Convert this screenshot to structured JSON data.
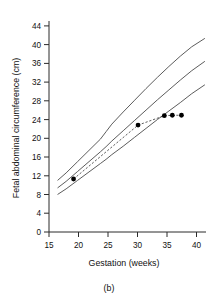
{
  "chart_data": {
    "type": "line",
    "title": "",
    "caption": "(b)",
    "xlabel": "Gestation (weeks)",
    "ylabel": "Fetal abdominal circumference (cm)",
    "xlim": [
      15,
      42.5
    ],
    "ylim": [
      0,
      45
    ],
    "xticks": [
      15,
      20,
      25,
      30,
      35,
      40
    ],
    "yticks": [
      0,
      4,
      8,
      12,
      16,
      20,
      24,
      28,
      32,
      36,
      40,
      44
    ],
    "grid": false,
    "legend": "none",
    "series": [
      {
        "name": "Upper reference centile",
        "style": "solid",
        "x": [
          16.5,
          18,
          20,
          22,
          24,
          25,
          26,
          28,
          30,
          32,
          34,
          36,
          38,
          40,
          42.3
        ],
        "values": [
          11.0,
          12.6,
          15.0,
          17.4,
          19.8,
          21.4,
          23.0,
          25.6,
          28.1,
          30.6,
          33.0,
          35.3,
          37.5,
          39.5,
          41.3
        ]
      },
      {
        "name": "Median reference centile",
        "style": "solid",
        "x": [
          16.5,
          18,
          20,
          22,
          24,
          25,
          26,
          28,
          30,
          32,
          34,
          36,
          38,
          40,
          42.3
        ],
        "values": [
          9.4,
          10.8,
          12.9,
          15.0,
          17.1,
          18.2,
          19.4,
          21.6,
          23.8,
          26.0,
          28.2,
          30.3,
          32.4,
          34.4,
          36.4
        ]
      },
      {
        "name": "Lower reference centile",
        "style": "solid",
        "x": [
          16.5,
          18,
          20,
          22,
          24,
          25,
          26,
          28,
          30,
          32,
          34,
          36,
          38,
          40,
          42.3
        ],
        "values": [
          8.0,
          9.2,
          11.0,
          12.8,
          14.6,
          15.5,
          16.5,
          18.3,
          20.2,
          22.1,
          24.0,
          25.8,
          27.6,
          29.5,
          31.4
        ]
      },
      {
        "name": "Patient measurements",
        "style": "dashed-with-markers",
        "x": [
          19.3,
          30.6,
          35.2,
          36.6,
          38.2
        ],
        "values": [
          11.3,
          22.8,
          24.8,
          24.9,
          24.9
        ]
      }
    ],
    "annotations": []
  },
  "figure": {
    "caption_label": "(b)"
  }
}
